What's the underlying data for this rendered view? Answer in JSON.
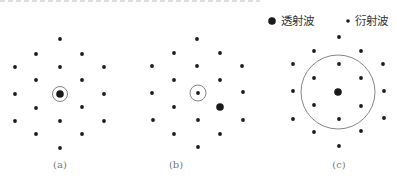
{
  "legend": {
    "transmitted": {
      "label": "透射波",
      "marker": "large-dot"
    },
    "diffracted": {
      "label": "衍射波",
      "marker": "small-dot"
    }
  },
  "colors": {
    "dot": "#1a1a1a",
    "circle": "#666666",
    "label": "#777777"
  },
  "panels": [
    {
      "id": "a",
      "label": "(a)",
      "transmitted": [
        60,
        94
      ],
      "aperture": {
        "cx": 60,
        "cy": 94,
        "r": 7.5
      },
      "diffracted": [
        [
          60,
          39
        ],
        [
          36,
          54
        ],
        [
          82,
          54
        ],
        [
          15,
          67
        ],
        [
          60,
          67
        ],
        [
          104,
          67
        ],
        [
          36,
          80
        ],
        [
          82,
          80
        ],
        [
          15,
          94
        ],
        [
          104,
          94
        ],
        [
          36,
          108
        ],
        [
          82,
          107
        ],
        [
          15,
          121
        ],
        [
          60,
          121
        ],
        [
          104,
          121
        ],
        [
          36,
          134
        ],
        [
          82,
          134
        ],
        [
          60,
          148
        ]
      ]
    },
    {
      "id": "b",
      "label": "(b)",
      "transmitted": [
        220,
        107
      ],
      "aperture": {
        "cx": 198,
        "cy": 93,
        "r": 8
      },
      "diffracted": [
        [
          197,
          39
        ],
        [
          174,
          53
        ],
        [
          220,
          53
        ],
        [
          152,
          66
        ],
        [
          197,
          66
        ],
        [
          242,
          66
        ],
        [
          174,
          80
        ],
        [
          220,
          80
        ],
        [
          198,
          93
        ],
        [
          152,
          93
        ],
        [
          243,
          92
        ],
        [
          174,
          107
        ],
        [
          153,
          120
        ],
        [
          198,
          120
        ],
        [
          243,
          120
        ],
        [
          174,
          134
        ],
        [
          220,
          134
        ],
        [
          198,
          147
        ]
      ]
    },
    {
      "id": "c",
      "label": "(c)",
      "transmitted": [
        338,
        92
      ],
      "aperture": {
        "cx": 338,
        "cy": 92,
        "r": 37
      },
      "diffracted": [
        [
          339,
          37
        ],
        [
          314,
          51
        ],
        [
          361,
          51
        ],
        [
          293,
          64
        ],
        [
          339,
          64
        ],
        [
          383,
          64
        ],
        [
          314,
          78
        ],
        [
          361,
          78
        ],
        [
          293,
          91
        ],
        [
          384,
          91
        ],
        [
          314,
          105
        ],
        [
          361,
          106
        ],
        [
          293,
          119
        ],
        [
          339,
          119
        ],
        [
          384,
          118
        ],
        [
          314,
          132
        ],
        [
          361,
          131
        ],
        [
          339,
          146
        ]
      ]
    }
  ]
}
